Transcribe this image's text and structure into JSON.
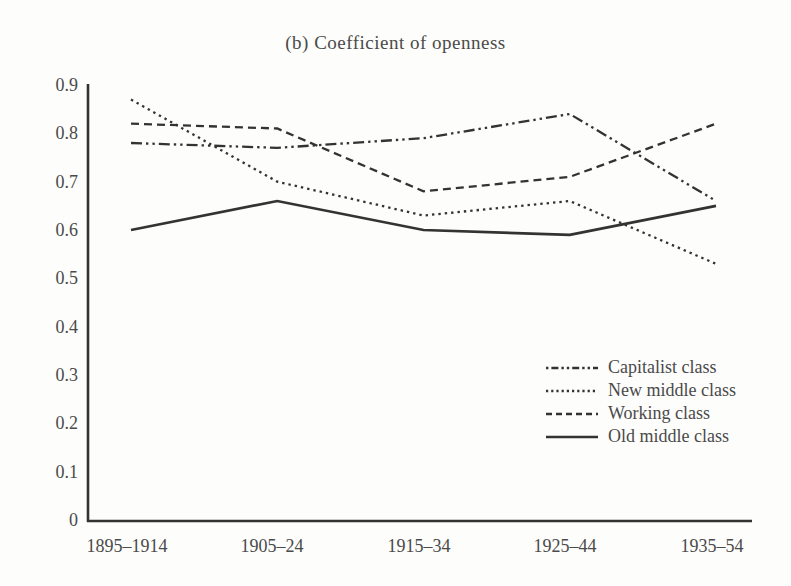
{
  "title": "(b) Coefficient of openness",
  "colors": {
    "line": "#333333",
    "text": "#4a4a4a",
    "background": "#fdfdfb"
  },
  "chart_data": {
    "type": "line",
    "title": "(b) Coefficient of openness",
    "xlabel": "",
    "ylabel": "",
    "ylim": [
      0,
      0.9
    ],
    "grid": false,
    "legend_position": "lower-right",
    "categories": [
      "1895–1914",
      "1905–24",
      "1915–34",
      "1925–44",
      "1935–54"
    ],
    "yticks": [
      "0.9",
      "0.8",
      "0.7",
      "0.6",
      "0.5",
      "0.4",
      "0.3",
      "0.2",
      "0.1",
      "0"
    ],
    "series": [
      {
        "name": "Capitalist class",
        "dash": "dash-dot-dot",
        "values": [
          0.78,
          0.77,
          0.79,
          0.84,
          0.66
        ]
      },
      {
        "name": "New middle class",
        "dash": "dotted",
        "values": [
          0.87,
          0.7,
          0.63,
          0.66,
          0.53
        ]
      },
      {
        "name": "Working class",
        "dash": "dashed",
        "values": [
          0.82,
          0.81,
          0.68,
          0.71,
          0.82
        ]
      },
      {
        "name": "Old middle class",
        "dash": "solid",
        "values": [
          0.6,
          0.66,
          0.6,
          0.59,
          0.65
        ]
      }
    ]
  }
}
